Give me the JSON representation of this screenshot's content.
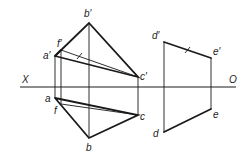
{
  "diagram": {
    "axis": {
      "left_label": "X",
      "right_label": "O"
    },
    "labels": {
      "b_prime": "b′",
      "f_prime": "f′",
      "a_prime": "a′",
      "c_prime": "c′",
      "a": "a",
      "f": "f",
      "c": "c",
      "b": "b",
      "d_prime": "d′",
      "e_prime": "e′",
      "d": "d",
      "e": "e"
    }
  }
}
